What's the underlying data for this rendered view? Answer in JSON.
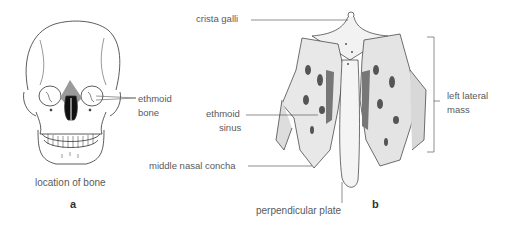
{
  "figure": {
    "panel_a": {
      "letter": "a",
      "caption": "location of bone",
      "labels": {
        "ethmoid_bone_line1": "ethmoid",
        "ethmoid_bone_line2": "bone"
      }
    },
    "panel_b": {
      "letter": "b",
      "labels": {
        "crista_galli": "crista galli",
        "ethmoid_sinus_line1": "ethmoid",
        "ethmoid_sinus_line2": "sinus",
        "middle_nasal_concha": "middle nasal concha",
        "perpendicular_plate": "perpendicular plate",
        "left_lateral_mass_line1": "left lateral",
        "left_lateral_mass_line2": "mass"
      }
    }
  }
}
